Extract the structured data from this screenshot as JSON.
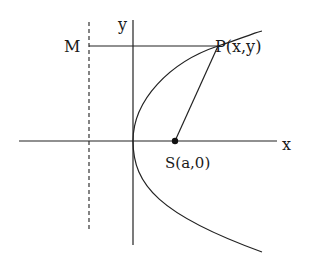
{
  "diagram": {
    "labels": {
      "y_axis": "y",
      "x_axis": "x",
      "directrix_point": "M",
      "point_on_curve": "P(x,y)",
      "focus": "S(a,0)"
    },
    "elements": [
      {
        "type": "axis",
        "name": "x-axis",
        "from": [
          19,
          141
        ],
        "to": [
          277,
          141
        ]
      },
      {
        "type": "axis",
        "name": "y-axis",
        "from": [
          133,
          20
        ],
        "to": [
          133,
          245
        ]
      },
      {
        "type": "dashed-line",
        "name": "directrix",
        "from": [
          89,
          22
        ],
        "to": [
          89,
          229
        ]
      },
      {
        "type": "line",
        "name": "PM",
        "from": [
          89,
          46
        ],
        "to": [
          218,
          46
        ]
      },
      {
        "type": "line",
        "name": "PS",
        "from": [
          218,
          46
        ],
        "to": [
          175,
          141
        ]
      },
      {
        "type": "curve",
        "name": "parabola",
        "vertex": [
          133,
          141
        ],
        "passes_through": [
          [
            262,
            31
          ],
          [
            218,
            46
          ],
          [
            262,
            252
          ]
        ]
      },
      {
        "type": "point",
        "name": "focus-S",
        "at": [
          175,
          141
        ]
      }
    ],
    "colors": {
      "stroke": "#222222",
      "background": "#ffffff"
    }
  }
}
